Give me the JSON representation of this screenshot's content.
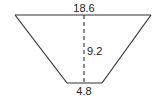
{
  "diagram": {
    "shape": "trapezoid",
    "labels": {
      "top_base": "18.6",
      "height": "9.2",
      "bottom_base": "4.8"
    },
    "colors": {
      "stroke": "#333333",
      "text": "#222222",
      "background": "#ffffff"
    }
  }
}
